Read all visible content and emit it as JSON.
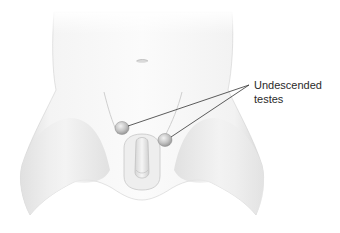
{
  "figure": {
    "annotation": {
      "line1": "Undescended",
      "line2": "testes"
    },
    "colors": {
      "background": "#ffffff",
      "skin_light": "#f6f6f6",
      "skin_mid": "#e4e4e4",
      "skin_shadow": "#c9c9c9",
      "testis_fill": "#bdbdbd",
      "leader_line": "#333333",
      "label_text": "#2a2a2a"
    }
  }
}
